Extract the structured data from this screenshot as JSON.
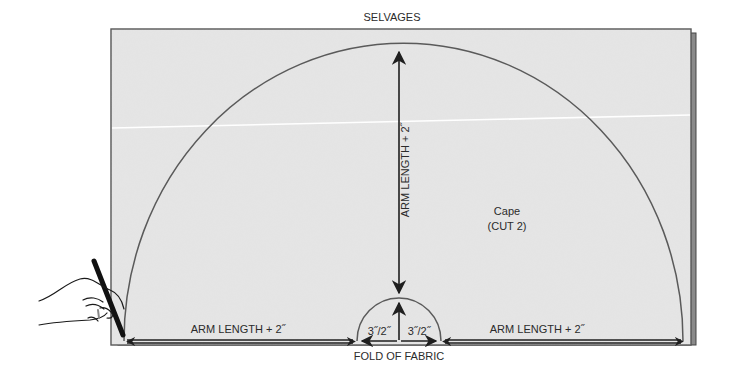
{
  "diagram": {
    "title_top": "SELVAGES",
    "title_bottom": "FOLD OF FABRIC",
    "piece": {
      "name": "Cape",
      "cut": "(CUT 2)"
    },
    "measurements": {
      "vertical_radius": "ARM LENGTH + 2˝",
      "left_base": "ARM LENGTH + 2˝",
      "right_base": "ARM LENGTH + 2˝",
      "neck_left": "3˝/2˝",
      "neck_right": "3˝/2˝"
    },
    "illustration": {
      "hand_with_marker": "hand-holding-marker-icon"
    },
    "colors": {
      "fabric": "#e4e4e4",
      "fabric_edge": "#555555",
      "back_layer": "#8a8a8a",
      "crease": "#ffffff",
      "line": "#1f1f1f",
      "arc": "#5a5a5a",
      "text": "#2b2b2b"
    }
  }
}
